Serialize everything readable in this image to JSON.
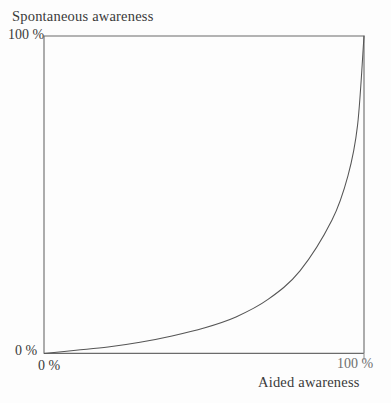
{
  "chart_data": {
    "type": "line",
    "title": "",
    "ylabel": "Spontaneous awareness",
    "xlabel": "Aided awareness",
    "xlim": [
      0,
      100
    ],
    "ylim": [
      0,
      100
    ],
    "grid": false,
    "legend": "none",
    "x_ticks": [
      "0 %",
      "100 %"
    ],
    "y_ticks": [
      "0 %",
      "100 %"
    ],
    "x_tick_values": [
      0,
      100
    ],
    "y_tick_values": [
      0,
      100
    ],
    "series": [
      {
        "name": "awareness relationship",
        "description": "Convex increasing exponential curve from origin to top-right corner",
        "x": [
          0,
          10,
          20,
          30,
          40,
          50,
          60,
          70,
          80,
          90,
          95,
          98,
          100
        ],
        "values": [
          0,
          1,
          2,
          3.5,
          5.5,
          8,
          11.5,
          17,
          26,
          42,
          56,
          72,
          100
        ]
      }
    ],
    "annotations": [],
    "line_color": "#555555",
    "frame_color": "#6b6b6b",
    "background_color": "#fdfdfd"
  },
  "axes": {
    "y_title": "Spontaneous awareness",
    "y_top_label": "100 %",
    "y_bottom_label": "0 %",
    "x_left_label": "0 %",
    "x_right_label": "100 %",
    "x_title": "Aided awareness"
  }
}
